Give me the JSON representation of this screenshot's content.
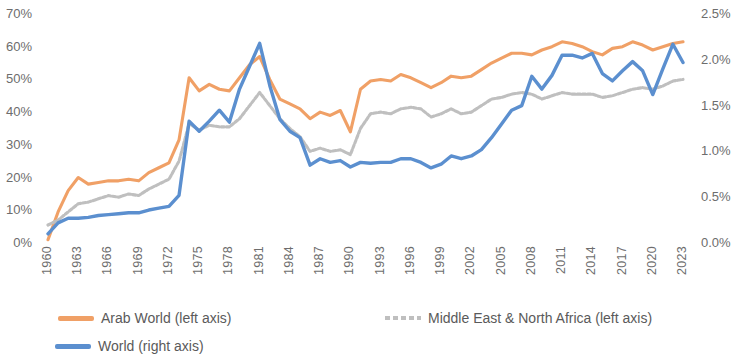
{
  "chart_data": {
    "type": "line",
    "title": "",
    "subtitle": "",
    "xlabel": "",
    "ylabel": "",
    "grid": false,
    "legend_position": "bottom",
    "x": [
      1960,
      1961,
      1962,
      1963,
      1964,
      1965,
      1966,
      1967,
      1968,
      1969,
      1970,
      1971,
      1972,
      1973,
      1974,
      1975,
      1976,
      1977,
      1978,
      1979,
      1980,
      1981,
      1982,
      1983,
      1984,
      1985,
      1986,
      1987,
      1988,
      1989,
      1990,
      1991,
      1992,
      1993,
      1994,
      1995,
      1996,
      1997,
      1998,
      1999,
      2000,
      2001,
      2002,
      2003,
      2004,
      2005,
      2006,
      2007,
      2008,
      2009,
      2010,
      2011,
      2012,
      2013,
      2014,
      2015,
      2016,
      2017,
      2018,
      2019,
      2020,
      2021,
      2022,
      2023
    ],
    "x_tick_labels": [
      "1960",
      "1963",
      "1966",
      "1969",
      "1972",
      "1975",
      "1978",
      "1981",
      "1984",
      "1987",
      "1990",
      "1993",
      "1996",
      "1999",
      "2002",
      "2005",
      "2008",
      "2011",
      "2014",
      "2017",
      "2020",
      "2023"
    ],
    "x_tick_step": 3,
    "axes": {
      "left": {
        "ticks": [
          "0%",
          "10%",
          "20%",
          "30%",
          "40%",
          "50%",
          "60%",
          "70%"
        ],
        "min": 0,
        "max": 70,
        "unit": "%",
        "step": 10
      },
      "right": {
        "ticks": [
          "0.0%",
          "0.5%",
          "1.0%",
          "1.5%",
          "2.0%",
          "2.5%"
        ],
        "min": 0,
        "max": 2.5,
        "unit": "%",
        "step": 0.5
      }
    },
    "series": [
      {
        "name": "Arab World (left axis)",
        "axis": "left",
        "color": "#F0A066",
        "style": "solid",
        "values": [
          1.0,
          9.5,
          16.0,
          20.0,
          18.0,
          18.5,
          19.0,
          19.0,
          19.5,
          19.0,
          21.5,
          23.0,
          24.5,
          31.5,
          50.5,
          46.5,
          48.5,
          47.0,
          46.5,
          50.5,
          54.5,
          57.0,
          50.0,
          44.0,
          42.5,
          41.0,
          38.0,
          40.0,
          39.0,
          40.5,
          34.0,
          47.0,
          49.5,
          50.0,
          49.5,
          51.5,
          50.5,
          49.0,
          47.5,
          49.0,
          51.0,
          50.5,
          51.0,
          53.0,
          55.0,
          56.5,
          58.0,
          58.0,
          57.5,
          59.0,
          60.0,
          61.5,
          61.0,
          60.0,
          58.5,
          57.5,
          59.5,
          60.0,
          61.5,
          60.5,
          59.0,
          60.0,
          61.0,
          61.5
        ]
      },
      {
        "name": "Middle East & North Africa (left axis)",
        "axis": "left",
        "color": "#BFBFBF",
        "style": "dotted",
        "values": [
          5.5,
          7.0,
          9.5,
          12.0,
          12.5,
          13.5,
          14.5,
          14.0,
          15.0,
          14.5,
          16.5,
          18.0,
          19.5,
          25.0,
          36.5,
          34.5,
          36.0,
          35.5,
          35.5,
          38.0,
          42.0,
          46.0,
          42.0,
          38.0,
          35.0,
          32.5,
          28.0,
          29.0,
          28.0,
          28.5,
          27.0,
          35.0,
          39.5,
          40.0,
          39.5,
          41.0,
          41.5,
          41.0,
          38.5,
          39.5,
          41.0,
          39.5,
          40.0,
          42.0,
          44.0,
          44.5,
          45.5,
          46.0,
          45.5,
          44.0,
          45.0,
          46.0,
          45.5,
          45.5,
          45.5,
          44.5,
          45.0,
          46.0,
          47.0,
          47.5,
          47.0,
          48.0,
          49.5,
          50.0
        ]
      },
      {
        "name": "World (right axis)",
        "axis": "right",
        "color": "#5B8FCF",
        "style": "solid",
        "values": [
          0.1,
          0.22,
          0.27,
          0.27,
          0.28,
          0.3,
          0.31,
          0.32,
          0.33,
          0.33,
          0.36,
          0.38,
          0.4,
          0.52,
          1.33,
          1.22,
          1.33,
          1.45,
          1.32,
          1.68,
          1.93,
          2.18,
          1.72,
          1.35,
          1.22,
          1.15,
          0.85,
          0.92,
          0.88,
          0.9,
          0.83,
          0.88,
          0.87,
          0.88,
          0.88,
          0.92,
          0.92,
          0.88,
          0.82,
          0.86,
          0.95,
          0.92,
          0.95,
          1.02,
          1.15,
          1.3,
          1.45,
          1.5,
          1.82,
          1.68,
          1.83,
          2.05,
          2.05,
          2.02,
          2.07,
          1.85,
          1.77,
          1.88,
          1.98,
          1.88,
          1.62,
          1.9,
          2.17,
          1.97
        ]
      }
    ]
  },
  "legend": {
    "items": [
      {
        "label": "Arab World (left axis)",
        "color": "#F0A066",
        "style": "solid"
      },
      {
        "label": "Middle East & North Africa (left axis)",
        "color": "#BFBFBF",
        "style": "dotted"
      },
      {
        "label": "World (right axis)",
        "color": "#5B8FCF",
        "style": "solid"
      }
    ]
  }
}
